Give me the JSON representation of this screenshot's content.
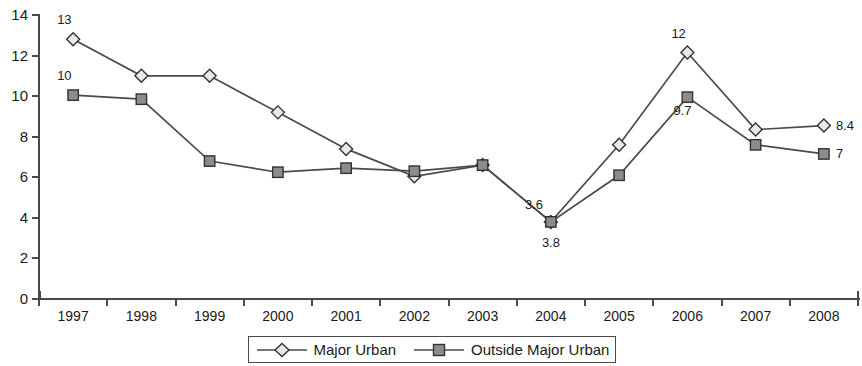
{
  "chart_data": {
    "type": "line",
    "title": "",
    "xlabel": "",
    "ylabel": "",
    "xlim": [
      1997,
      2008
    ],
    "ylim": [
      0,
      14
    ],
    "ytick_step": 2,
    "grid": false,
    "legend_position": "bottom-center",
    "categories": [
      "1997",
      "1998",
      "1999",
      "2000",
      "2001",
      "2002",
      "2003",
      "2004",
      "2005",
      "2006",
      "2007",
      "2008"
    ],
    "yticks": [
      "0",
      "2",
      "4",
      "6",
      "8",
      "10",
      "12",
      "14"
    ],
    "series": [
      {
        "name": "Major Urban",
        "marker": "diamond",
        "marker_fill": "#e8e8e8",
        "line_color": "#4a4a4a",
        "values": [
          12.8,
          11.0,
          11.0,
          9.2,
          7.4,
          6.05,
          6.6,
          3.8,
          7.6,
          12.15,
          8.35,
          8.55
        ]
      },
      {
        "name": "Outside Major Urban",
        "marker": "square",
        "marker_fill": "#8c8c8c",
        "line_color": "#4a4a4a",
        "values": [
          10.05,
          9.85,
          6.8,
          6.25,
          6.45,
          6.3,
          6.6,
          3.8,
          6.1,
          9.95,
          7.6,
          7.15
        ]
      }
    ],
    "annotations": [
      {
        "text": "13",
        "series": "Major Urban",
        "category": "1997",
        "position": "above"
      },
      {
        "text": "10",
        "series": "Outside Major Urban",
        "category": "1997",
        "position": "above"
      },
      {
        "text": "3.6",
        "series": "Outside Major Urban",
        "category": "2004",
        "position": "above-left"
      },
      {
        "text": "3.8",
        "series": "Major Urban",
        "category": "2004",
        "position": "below"
      },
      {
        "text": "12",
        "series": "Major Urban",
        "category": "2006",
        "position": "above"
      },
      {
        "text": "9.7",
        "series": "Outside Major Urban",
        "category": "2006",
        "position": "below-left"
      },
      {
        "text": "8.4",
        "series": "Major Urban",
        "category": "2008",
        "position": "right"
      },
      {
        "text": "7",
        "series": "Outside Major Urban",
        "category": "2008",
        "position": "right"
      }
    ]
  },
  "legend": {
    "entries": [
      {
        "label": "Major Urban"
      },
      {
        "label": "Outside Major Urban"
      }
    ]
  },
  "colors": {
    "axis": "#4a4a4a",
    "line": "#4a4a4a",
    "diamond_fill": "#e8e8e8",
    "square_fill": "#8c8c8c",
    "text": "#1a1a1a",
    "background": "#ffffff"
  }
}
